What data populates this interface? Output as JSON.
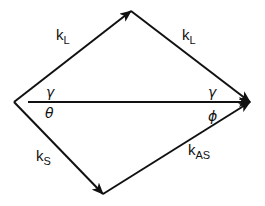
{
  "diagram": {
    "type": "wave-vector phase-matching diagram",
    "vectors": [
      {
        "id": "kL_1",
        "label": "k",
        "subscript": "L",
        "from": "left",
        "to": "top"
      },
      {
        "id": "kL_2",
        "label": "k",
        "subscript": "L",
        "from": "top",
        "to": "right"
      },
      {
        "id": "kS",
        "label": "k",
        "subscript": "S",
        "from": "left",
        "to": "bottom"
      },
      {
        "id": "kAS",
        "label": "k",
        "subscript": "AS",
        "from": "bottom",
        "to": "right"
      },
      {
        "id": "baseline",
        "label": "",
        "from": "left",
        "to": "right"
      }
    ],
    "angles": {
      "gamma_left": "γ",
      "gamma_right": "γ",
      "theta": "θ",
      "phi": "ϕ"
    },
    "colors": {
      "stroke": "#111111",
      "background": "#ffffff"
    }
  }
}
